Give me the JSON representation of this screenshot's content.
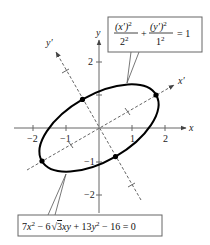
{
  "diagram": {
    "type": "rotated-ellipse-plot",
    "axes": {
      "x_label": "x",
      "y_label": "y",
      "x_prime_label": "x′",
      "y_prime_label": "y′",
      "x_ticks": [
        "−2",
        "−1",
        "1",
        "2"
      ],
      "y_ticks": [
        "2",
        "1",
        "−1",
        "−2"
      ],
      "rotation_degrees": 30
    },
    "ellipse": {
      "center": [
        0,
        0
      ],
      "semi_major": 2,
      "semi_minor": 1,
      "marked_points_prime": [
        [
          2,
          0
        ],
        [
          -2,
          0
        ],
        [
          0,
          1
        ],
        [
          0,
          -1
        ]
      ]
    },
    "callouts": {
      "standard_form": {
        "num1": "(x′)",
        "exp1": "2",
        "den1": "2",
        "den1_exp": "2",
        "plus": "+",
        "num2": "(y′)",
        "exp2": "2",
        "den2": "1",
        "den2_exp": "2",
        "equals": "= 1"
      },
      "general_form": {
        "text_a": "7",
        "var_x": "x",
        "exp_a": "2",
        "text_b": " − 6",
        "sqrt_arg": "3",
        "var_xy": "xy",
        "text_c": " + 13",
        "var_y": "y",
        "exp_c": "2",
        "text_d": " − 16 = 0"
      }
    },
    "colors": {
      "curve": "#000000",
      "axes": "#555555",
      "rotated_axes": "#666666",
      "box_border": "#666666"
    }
  }
}
